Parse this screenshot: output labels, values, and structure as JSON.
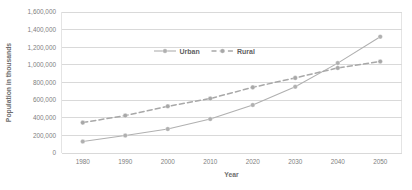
{
  "chart_data": {
    "type": "line",
    "title": "",
    "xlabel": "Year",
    "ylabel": "Population in thousands",
    "categories": [
      "1980",
      "1990",
      "2000",
      "2010",
      "2020",
      "2030",
      "2040",
      "2050"
    ],
    "x": [
      1980,
      1990,
      2000,
      2010,
      2020,
      2030,
      2040,
      2050
    ],
    "xlim": [
      1975,
      2055
    ],
    "ylim": [
      0,
      1600000
    ],
    "ytick_step": 200000,
    "ytick_labels": [
      "0",
      "200,000",
      "400,000",
      "600,000",
      "800,000",
      "1,000,000",
      "1,200,000",
      "1,400,000",
      "1,600,000"
    ],
    "ytick_values": [
      0,
      200000,
      400000,
      600000,
      800000,
      1000000,
      1200000,
      1400000,
      1600000
    ],
    "grid": true,
    "legend_position": "top-center",
    "series": [
      {
        "name": "Urban",
        "style": "solid",
        "color": "#b0b0b0",
        "marker": "circle",
        "values": [
          130000,
          198000,
          272000,
          385000,
          545000,
          752000,
          1020000,
          1320000
        ]
      },
      {
        "name": "Rural",
        "style": "dashed",
        "color": "#a8a8a8",
        "marker": "circle",
        "values": [
          345000,
          425000,
          530000,
          618000,
          745000,
          852000,
          965000,
          1038000
        ]
      }
    ]
  },
  "colors": {
    "gridline": "#c9c9c9",
    "frame": "#d8d8d8",
    "tick_text": "#808080",
    "axis_title_text": "#6e6e6e",
    "legend_text": "#5f5f5f",
    "urban": "#b0b0b0",
    "rural": "#a8a8a8",
    "background": "#ffffff"
  },
  "legend": {
    "items": [
      {
        "label": "Urban",
        "style": "solid"
      },
      {
        "label": "Rural",
        "style": "dashed"
      }
    ]
  }
}
